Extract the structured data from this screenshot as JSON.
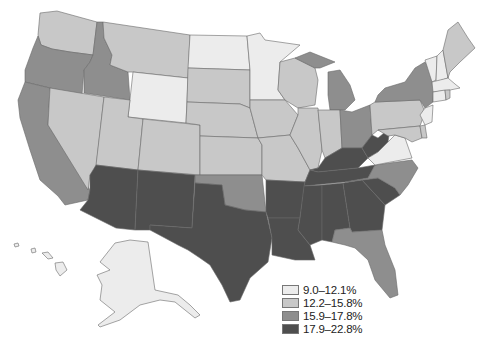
{
  "map": {
    "title": "",
    "region": "United States",
    "colors": {
      "cat1": "#ececec",
      "cat2": "#c8c8c8",
      "cat3": "#8e8e8e",
      "cat4": "#4e4e4e"
    }
  },
  "legend": {
    "items": [
      {
        "label": "9.0–12.1%",
        "color": "#ececec"
      },
      {
        "label": "12.2–15.8%",
        "color": "#c8c8c8"
      },
      {
        "label": "15.9–17.8%",
        "color": "#8e8e8e"
      },
      {
        "label": "17.9–22.8%",
        "color": "#4e4e4e"
      }
    ]
  },
  "states": {
    "9.0–12.1%": [
      "North Dakota",
      "Minnesota",
      "Wyoming",
      "Vermont",
      "New Hampshire",
      "Massachusetts",
      "Connecticut",
      "New Jersey",
      "Virginia",
      "Alaska",
      "Hawaii",
      "Rhode Island"
    ],
    "12.2–15.8%": [
      "Washington",
      "Montana",
      "South Dakota",
      "Nebraska",
      "Kansas",
      "Iowa",
      "Wisconsin",
      "Illinois",
      "Indiana",
      "Missouri",
      "Nevada",
      "Utah",
      "Colorado",
      "Pennsylvania",
      "Maine",
      "Maryland",
      "Delaware"
    ],
    "15.9–17.8%": [
      "Oregon",
      "Idaho",
      "California",
      "Michigan",
      "Ohio",
      "New York",
      "Oklahoma",
      "North Carolina",
      "Florida"
    ],
    "17.9–22.8%": [
      "Arizona",
      "New Mexico",
      "Texas",
      "Louisiana",
      "Arkansas",
      "Mississippi",
      "Alabama",
      "Georgia",
      "South Carolina",
      "Tennessee",
      "Kentucky",
      "West Virginia"
    ]
  }
}
